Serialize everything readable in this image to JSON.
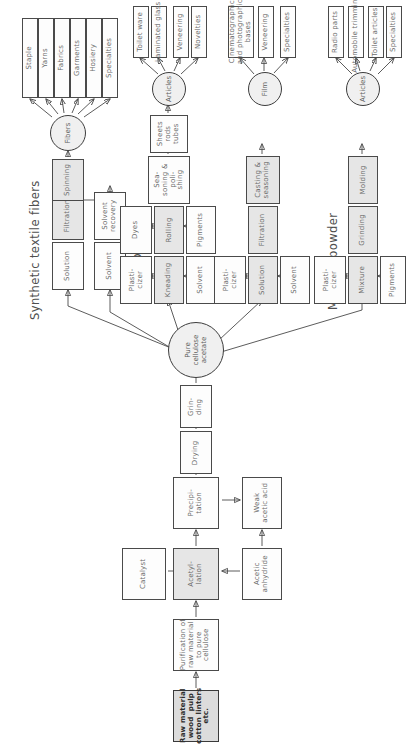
{
  "diagram": {
    "sections": [
      {
        "id": "fibers",
        "label": "Synthetic textile fibers"
      },
      {
        "id": "sheet",
        "label": "Sheet plastics"
      },
      {
        "id": "film",
        "label": "Film"
      },
      {
        "id": "molding",
        "label": "Molding powder"
      }
    ],
    "hubs": [
      {
        "id": "fibers_hub",
        "label": "Fibers"
      },
      {
        "id": "articles_hub_sheet",
        "label": "Articles"
      },
      {
        "id": "film_hub",
        "label": "Film"
      },
      {
        "id": "articles_hub_molding",
        "label": "Articles"
      }
    ],
    "central_node": {
      "id": "pure_cellulose_acetate",
      "label": "Pure\ncellulose\nacetate"
    },
    "base_chain": [
      {
        "id": "raw_material",
        "label": "Raw material\nwood  pulp\ncotton linters\netc."
      },
      {
        "id": "purification",
        "label": "Purification of\nraw material\nto pure\ncellulose"
      },
      {
        "id": "acetylation",
        "label": "Acetyl-\nlation"
      },
      {
        "id": "precipitation",
        "label": "Precipi-\ntation"
      },
      {
        "id": "drying",
        "label": "Drying"
      },
      {
        "id": "grinding",
        "label": "Grin-\nding"
      }
    ],
    "reagents": [
      {
        "id": "catalyst",
        "label": "Catalyst"
      },
      {
        "id": "acetic_anhydride",
        "label": "Acetic\nanhydride"
      },
      {
        "id": "weak_acetic_acid",
        "label": "Weak\nacetic acid"
      }
    ],
    "fibers_branch": {
      "steps": [
        {
          "id": "fib_solution",
          "label": "Solution"
        },
        {
          "id": "fib_filtration",
          "label": "Filtration"
        },
        {
          "id": "fib_spinning",
          "label": "Spinning"
        }
      ],
      "aux": [
        {
          "id": "fib_solvent",
          "label": "Solvent"
        },
        {
          "id": "fib_solvent_recovery",
          "label": "Solvent\nrecovery"
        }
      ],
      "products": [
        {
          "id": "p_staple",
          "label": "Staple"
        },
        {
          "id": "p_yarns",
          "label": "Yarns"
        },
        {
          "id": "p_fabrics",
          "label": "Fabrics"
        },
        {
          "id": "p_garments",
          "label": "Garments"
        },
        {
          "id": "p_hosiery",
          "label": "Hosiery"
        },
        {
          "id": "p_specialties",
          "label": "Specialties"
        }
      ]
    },
    "sheet_branch": {
      "steps": [
        {
          "id": "sh_kneading",
          "label": "Kneading"
        },
        {
          "id": "sh_rolling",
          "label": "Rolling"
        },
        {
          "id": "sh_seasoning",
          "label": "Sea-\nsoning &\npoli-\nshing"
        },
        {
          "id": "sh_sheets",
          "label": "Sheets\nrods\ntubes"
        }
      ],
      "aux": [
        {
          "id": "sh_plasticizer",
          "label": "Plasti-\ncizer"
        },
        {
          "id": "sh_solvent",
          "label": "Solvent"
        },
        {
          "id": "sh_dyes",
          "label": "Dyes"
        },
        {
          "id": "sh_pigments",
          "label": "Pigments"
        }
      ],
      "products": [
        {
          "id": "p_toilet_ware",
          "label": "Toilet ware"
        },
        {
          "id": "p_laminated_glass",
          "label": "Laminated glass"
        },
        {
          "id": "p_veneering_sheet",
          "label": "Veneering"
        },
        {
          "id": "p_novelties",
          "label": "Novelties"
        }
      ]
    },
    "film_branch": {
      "steps": [
        {
          "id": "fl_solution",
          "label": "Solution"
        },
        {
          "id": "fl_filtration",
          "label": "Filtration"
        },
        {
          "id": "fl_casting",
          "label": "Casting &\nseasoning"
        }
      ],
      "aux": [
        {
          "id": "fl_plasticizer",
          "label": "Plasti-\ncizer"
        },
        {
          "id": "fl_solvent",
          "label": "Solvent"
        }
      ],
      "products": [
        {
          "id": "p_cine_bases",
          "label": "Cinematographic\nand photographic\nbases"
        },
        {
          "id": "p_veneering_film",
          "label": "Veneering"
        },
        {
          "id": "p_specialties_film",
          "label": "Specialties"
        }
      ]
    },
    "molding_branch": {
      "steps": [
        {
          "id": "mo_mixture",
          "label": "Mixture"
        },
        {
          "id": "mo_grinding",
          "label": "Grinding"
        },
        {
          "id": "mo_molding",
          "label": "Molding"
        }
      ],
      "aux": [
        {
          "id": "mo_plasticizer",
          "label": "Plasti-\ncizer"
        },
        {
          "id": "mo_pigments",
          "label": "Pigments"
        }
      ],
      "products": [
        {
          "id": "p_radio_parts",
          "label": "Radio parts"
        },
        {
          "id": "p_auto_trimmings",
          "label": "Automobile trimmings"
        },
        {
          "id": "p_toilet_articles",
          "label": "Toilet articles"
        },
        {
          "id": "p_specialties_molding",
          "label": "Specialties"
        }
      ]
    }
  }
}
